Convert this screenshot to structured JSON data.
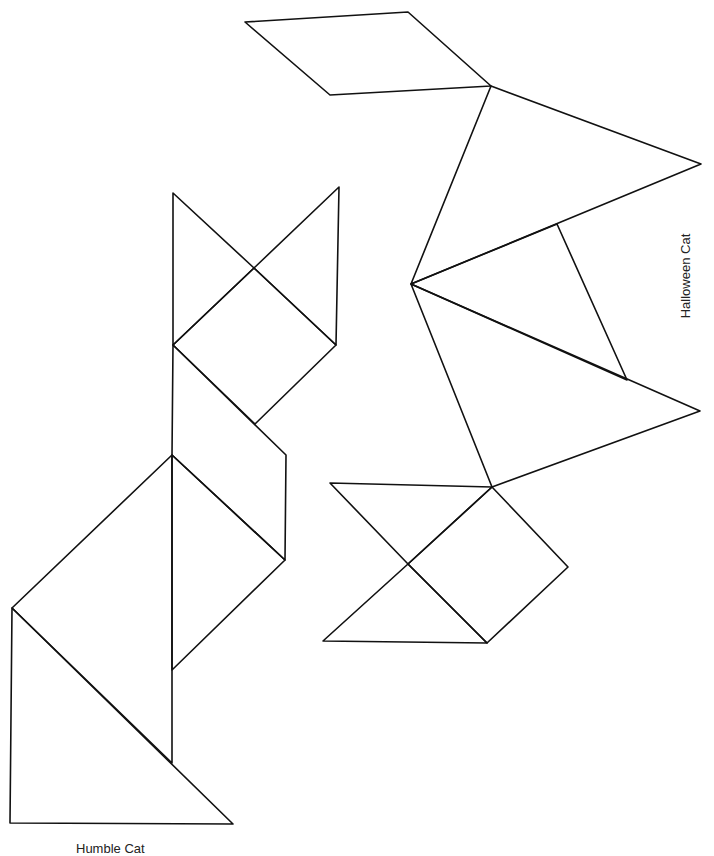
{
  "figures": [
    {
      "title": "Halloween Cat",
      "caption_position": "right, rotated",
      "pieces": [
        {
          "id": "parallelogram",
          "points": [
            [
              245,
              22
            ],
            [
              408,
              12
            ],
            [
              491,
              86
            ],
            [
              330,
              95
            ]
          ]
        },
        {
          "id": "large-triangle-upper",
          "points": [
            [
              491,
              86
            ],
            [
              701,
              164
            ],
            [
              411,
              284
            ]
          ]
        },
        {
          "id": "medium-triangle",
          "points": [
            [
              411,
              284
            ],
            [
              557,
              224
            ],
            [
              627,
              380
            ]
          ]
        },
        {
          "id": "large-triangle-lower",
          "points": [
            [
              411,
              284
            ],
            [
              700,
              411
            ],
            [
              492,
              487
            ]
          ]
        },
        {
          "id": "square",
          "points": [
            [
              492,
              487
            ],
            [
              568,
              567
            ],
            [
              487,
              643
            ],
            [
              408,
              564
            ]
          ]
        },
        {
          "id": "small-triangle-top",
          "points": [
            [
              330,
              483
            ],
            [
              492,
              487
            ],
            [
              408,
              564
            ]
          ]
        },
        {
          "id": "small-triangle-bottom",
          "points": [
            [
              408,
              564
            ],
            [
              487,
              643
            ],
            [
              323,
              641
            ]
          ]
        }
      ]
    },
    {
      "title": "Humble Cat",
      "caption_position": "bottom, partially clipped",
      "pieces": [
        {
          "id": "small-triangle-left-ear",
          "points": [
            [
              173,
              193
            ],
            [
              254,
              268
            ],
            [
              173,
              345
            ]
          ]
        },
        {
          "id": "small-triangle-right-ear",
          "points": [
            [
              339,
              187
            ],
            [
              336,
              345
            ],
            [
              254,
              268
            ]
          ]
        },
        {
          "id": "square-head",
          "points": [
            [
              173,
              345
            ],
            [
              254,
              268
            ],
            [
              336,
              345
            ],
            [
              255,
              424
            ]
          ]
        },
        {
          "id": "parallelogram-neck",
          "points": [
            [
              173,
              345
            ],
            [
              286,
              455
            ],
            [
              285,
              560
            ],
            [
              172,
              455
            ]
          ]
        },
        {
          "id": "medium-triangle-body",
          "points": [
            [
              172,
              455
            ],
            [
              285,
              560
            ],
            [
              172,
              670
            ]
          ]
        },
        {
          "id": "large-triangle-body",
          "points": [
            [
              172,
              455
            ],
            [
              172,
              763
            ],
            [
              12,
              608
            ]
          ]
        },
        {
          "id": "large-triangle-base",
          "points": [
            [
              12,
              608
            ],
            [
              233,
              824
            ],
            [
              10,
              823
            ]
          ]
        }
      ]
    }
  ],
  "labels": {
    "right": "Halloween Cat",
    "bottom": "Humble Cat"
  },
  "style": {
    "stroke": "#111111",
    "background": "#ffffff"
  }
}
